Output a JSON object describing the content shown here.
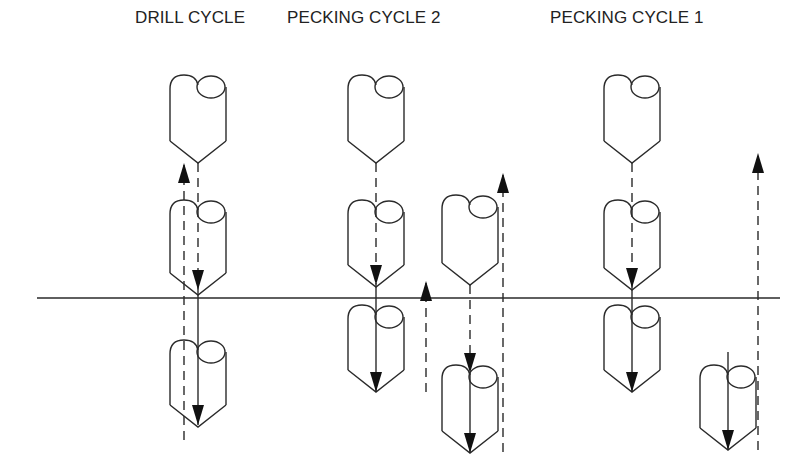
{
  "labels": {
    "drill_cycle": "DRILL CYCLE",
    "pecking_cycle_2": "PECKING CYCLE 2",
    "pecking_cycle_1": "PECKING CYCLE 1"
  },
  "colors": {
    "stroke": "#2a2a2a",
    "background": "#ffffff"
  },
  "surface_line": {
    "y": 298,
    "x1": 37,
    "x2": 780
  },
  "drills": [
    {
      "group": "drill-cycle",
      "cx": 198,
      "top": 75,
      "tip": 163
    },
    {
      "group": "drill-cycle",
      "cx": 198,
      "top": 200,
      "tip": 295
    },
    {
      "group": "drill-cycle",
      "cx": 198,
      "top": 340,
      "tip": 427
    },
    {
      "group": "pecking-cycle-2",
      "cx": 376,
      "top": 75,
      "tip": 163
    },
    {
      "group": "pecking-cycle-2",
      "cx": 376,
      "top": 200,
      "tip": 287
    },
    {
      "group": "pecking-cycle-2",
      "cx": 376,
      "top": 305,
      "tip": 392
    },
    {
      "group": "pecking-cycle-2",
      "cx": 470,
      "top": 195,
      "tip": 285
    },
    {
      "group": "pecking-cycle-2",
      "cx": 470,
      "top": 365,
      "tip": 453
    },
    {
      "group": "pecking-cycle-1",
      "cx": 632,
      "top": 75,
      "tip": 163
    },
    {
      "group": "pecking-cycle-1",
      "cx": 632,
      "top": 200,
      "tip": 290
    },
    {
      "group": "pecking-cycle-1",
      "cx": 632,
      "top": 305,
      "tip": 392
    },
    {
      "group": "pecking-cycle-1",
      "cx": 728,
      "top": 365,
      "tip": 450
    }
  ],
  "paths": [
    {
      "x": 184,
      "y1": 440,
      "y2": 165,
      "style": "dashed",
      "arrow": "up"
    },
    {
      "x": 198,
      "y1": 163,
      "y2": 290,
      "style": "dashed",
      "arrow": "down"
    },
    {
      "x": 198,
      "y1": 290,
      "y2": 425,
      "style": "solid",
      "arrow": "down"
    },
    {
      "x": 376,
      "y1": 163,
      "y2": 285,
      "style": "dashed",
      "arrow": "down"
    },
    {
      "x": 376,
      "y1": 285,
      "y2": 392,
      "style": "solid",
      "arrow": "down"
    },
    {
      "x": 426,
      "y1": 392,
      "y2": 283,
      "style": "dashed",
      "arrow": "up"
    },
    {
      "x": 470,
      "y1": 285,
      "y2": 373,
      "style": "dashed",
      "arrow": "down"
    },
    {
      "x": 470,
      "y1": 373,
      "y2": 453,
      "style": "solid",
      "arrow": "down"
    },
    {
      "x": 503,
      "y1": 452,
      "y2": 175,
      "style": "dashed",
      "arrow": "up"
    },
    {
      "x": 632,
      "y1": 163,
      "y2": 288,
      "style": "dashed",
      "arrow": "down"
    },
    {
      "x": 632,
      "y1": 288,
      "y2": 392,
      "style": "solid",
      "arrow": "down"
    },
    {
      "x": 728,
      "y1": 352,
      "y2": 450,
      "style": "solid",
      "arrow": "down"
    },
    {
      "x": 758,
      "y1": 450,
      "y2": 155,
      "style": "dashed",
      "arrow": "up"
    }
  ]
}
